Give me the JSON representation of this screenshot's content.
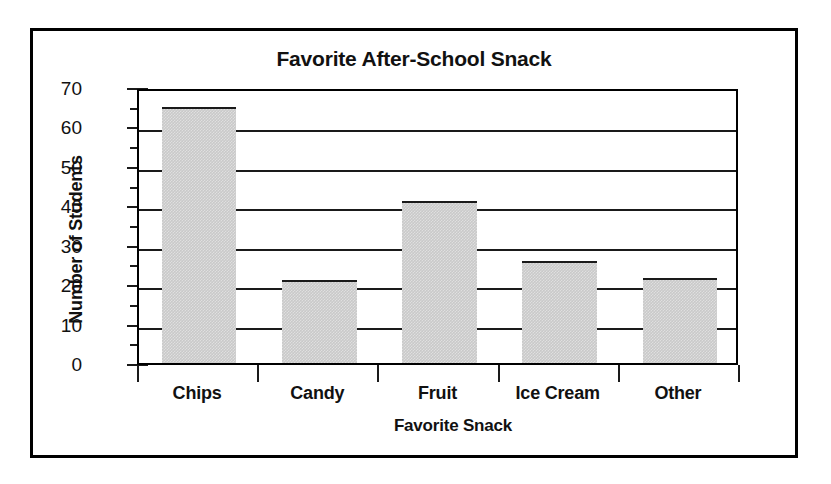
{
  "chart_data": {
    "type": "bar",
    "title": "Favorite After-School Snack",
    "xlabel": "Favorite Snack",
    "ylabel": "Number of Students",
    "categories": [
      "Chips",
      "Candy",
      "Fruit",
      "Ice Cream",
      "Other"
    ],
    "values": [
      65,
      21,
      41,
      26,
      21.5
    ],
    "ylim": [
      0,
      70
    ],
    "ytick_labels": [
      "0",
      "10",
      "20",
      "30",
      "40",
      "50",
      "60",
      "70"
    ],
    "ytick_values": [
      0,
      10,
      20,
      30,
      40,
      50,
      60,
      70
    ],
    "yminor_values": [
      5,
      15,
      25,
      35,
      45,
      55,
      65
    ],
    "ytick_step": 10,
    "yminor_step": 5,
    "grid": "horizontal",
    "legend": "none",
    "bar_color": "#c9c9c9",
    "bar_edge_color": "#1a1a1a",
    "axis_color": "#000000",
    "background_color": "#ffffff"
  }
}
